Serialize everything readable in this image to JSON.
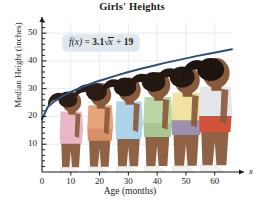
{
  "chart_data": {
    "type": "line",
    "title": "Girls' Heights",
    "xlabel": "Age (months)",
    "ylabel": "Median Height (inches)",
    "axis_end_label": "x",
    "equation": "f(x) = 3.1√x + 19",
    "equation_parts": {
      "fn": "f",
      "arg": "(x)",
      "equals": "=",
      "coefficient": "3.1",
      "radicand": "x",
      "plus": "+",
      "constant": "19"
    },
    "xlim": [
      0,
      66
    ],
    "ylim": [
      0,
      54
    ],
    "xticks": [
      0,
      10,
      20,
      30,
      40,
      50,
      60
    ],
    "yticks": [
      10,
      20,
      30,
      40,
      50
    ],
    "y_minor_tick_step": 2,
    "grid": true,
    "legend": "none",
    "series": [
      {
        "name": "Median height",
        "color": "#2f4f7a",
        "x": [
          0,
          2,
          4,
          6,
          8,
          10,
          14,
          18,
          22,
          26,
          30,
          34,
          38,
          42,
          46,
          50,
          54,
          58,
          62,
          66
        ],
        "y": [
          19.0,
          23.4,
          25.2,
          26.6,
          27.8,
          28.8,
          30.6,
          32.2,
          33.5,
          34.8,
          36.0,
          37.1,
          38.1,
          39.1,
          40.0,
          40.9,
          41.8,
          42.6,
          43.4,
          44.2
        ]
      }
    ],
    "figures": [
      {
        "age": 10,
        "height": 29,
        "top": "#e9b8c6",
        "bottom": "#e9b8c6",
        "skin": "#8a5a3b",
        "hair": "#2b1d16"
      },
      {
        "age": 20,
        "height": 32,
        "top": "#e8a47c",
        "bottom": "#d98f68",
        "skin": "#8a5a3b",
        "hair": "#2b1d16"
      },
      {
        "age": 30,
        "height": 34,
        "top": "#aed4ea",
        "bottom": "#aed4ea",
        "skin": "#8a5a3b",
        "hair": "#241812"
      },
      {
        "age": 40,
        "height": 36,
        "top": "#b9d6a4",
        "bottom": "#a9c794",
        "skin": "#8a5a3b",
        "hair": "#241812"
      },
      {
        "age": 50,
        "height": 38,
        "top": "#f0e2a0",
        "bottom": "#9d90ae",
        "skin": "#8a5a3b",
        "hair": "#241812"
      },
      {
        "age": 60,
        "height": 41,
        "top": "#e3e6ea",
        "bottom": "#cf5239",
        "skin": "#8a5a3b",
        "hair": "#1e140f"
      }
    ],
    "colors": {
      "curve": "#2f4f7a",
      "grid": "#e6ecf0",
      "axis": "#1a1a1a",
      "equation_box": "#dfe8ee",
      "title": "#1a1a1a"
    }
  }
}
